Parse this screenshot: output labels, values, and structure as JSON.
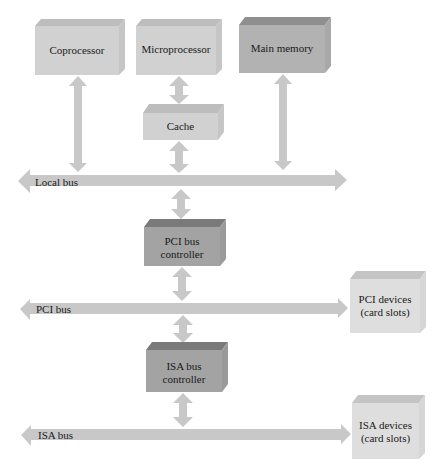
{
  "diagram": {
    "type": "computer-bus-architecture",
    "colors": {
      "box_light": "#d4d4d4",
      "box_medium": "#b9b9b9",
      "box_dark": "#9e9e9e",
      "arrow": "#c8c8c8"
    },
    "nodes": {
      "coprocessor": "Coprocessor",
      "microprocessor": "Microprocessor",
      "main_memory": "Main memory",
      "cache": "Cache",
      "pci_controller_1": "PCI bus",
      "pci_controller_2": "controller",
      "isa_controller_1": "ISA bus",
      "isa_controller_2": "controller",
      "pci_devices_1": "PCI devices",
      "pci_devices_2": "(card slots)",
      "isa_devices_1": "ISA devices",
      "isa_devices_2": "(card slots)"
    },
    "buses": {
      "local": "Local bus",
      "pci": "PCI bus",
      "isa": "ISA bus"
    }
  }
}
